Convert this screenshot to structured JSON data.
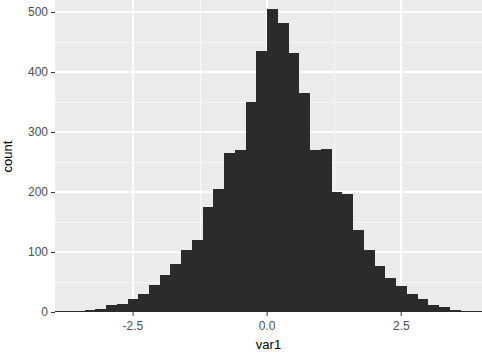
{
  "chart_data": {
    "type": "bar",
    "subtype": "histogram",
    "title": "",
    "subtitle": "",
    "xlabel": "var1",
    "ylabel": "count",
    "xlim": [
      -3.95,
      4.0
    ],
    "ylim": [
      0,
      520
    ],
    "grid": true,
    "legend": null,
    "binwidth": 0.2,
    "bar_color": "#2b2b2b",
    "panel_background": "#ebebeb",
    "gridline_color": "#ffffff",
    "x_ticks": [
      {
        "value": -2.5,
        "label": "-2.5"
      },
      {
        "value": 0.0,
        "label": "0.0"
      },
      {
        "value": 2.5,
        "label": "2.5"
      }
    ],
    "x_minor_ticks": [
      -1.25,
      1.25
    ],
    "y_ticks": [
      {
        "value": 0,
        "label": "0"
      },
      {
        "value": 100,
        "label": "100"
      },
      {
        "value": 200,
        "label": "200"
      },
      {
        "value": 300,
        "label": "300"
      },
      {
        "value": 400,
        "label": "400"
      },
      {
        "value": 500,
        "label": "500"
      }
    ],
    "y_minor_ticks": [
      50,
      150,
      250,
      350,
      450
    ],
    "bins": [
      {
        "x": -3.9,
        "count": 1
      },
      {
        "x": -3.7,
        "count": 1
      },
      {
        "x": -3.5,
        "count": 2
      },
      {
        "x": -3.3,
        "count": 3
      },
      {
        "x": -3.1,
        "count": 5
      },
      {
        "x": -2.9,
        "count": 11
      },
      {
        "x": -2.7,
        "count": 14
      },
      {
        "x": -2.5,
        "count": 21
      },
      {
        "x": -2.3,
        "count": 30
      },
      {
        "x": -2.1,
        "count": 45
      },
      {
        "x": -1.9,
        "count": 62
      },
      {
        "x": -1.7,
        "count": 80
      },
      {
        "x": -1.5,
        "count": 103
      },
      {
        "x": -1.3,
        "count": 120
      },
      {
        "x": -1.1,
        "count": 175
      },
      {
        "x": -0.9,
        "count": 205
      },
      {
        "x": -0.7,
        "count": 265
      },
      {
        "x": -0.5,
        "count": 270
      },
      {
        "x": -0.3,
        "count": 350
      },
      {
        "x": -0.1,
        "count": 435
      },
      {
        "x": 0.1,
        "count": 505
      },
      {
        "x": 0.3,
        "count": 482
      },
      {
        "x": 0.5,
        "count": 432
      },
      {
        "x": 0.7,
        "count": 365
      },
      {
        "x": 0.9,
        "count": 270
      },
      {
        "x": 1.1,
        "count": 272
      },
      {
        "x": 1.3,
        "count": 200
      },
      {
        "x": 1.5,
        "count": 196
      },
      {
        "x": 1.7,
        "count": 136
      },
      {
        "x": 1.9,
        "count": 104
      },
      {
        "x": 2.1,
        "count": 76
      },
      {
        "x": 2.3,
        "count": 56
      },
      {
        "x": 2.5,
        "count": 44
      },
      {
        "x": 2.7,
        "count": 30
      },
      {
        "x": 2.9,
        "count": 22
      },
      {
        "x": 3.1,
        "count": 12
      },
      {
        "x": 3.3,
        "count": 8
      },
      {
        "x": 3.5,
        "count": 4
      },
      {
        "x": 3.7,
        "count": 2
      },
      {
        "x": 3.9,
        "count": 2
      }
    ]
  },
  "axes": {
    "x_title": "var1",
    "y_title": "count"
  }
}
